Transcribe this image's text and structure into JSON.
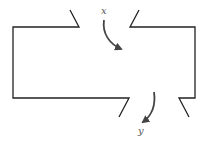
{
  "diagram": {
    "type": "control-volume",
    "labels": {
      "inflow": "x",
      "outflow": "y"
    },
    "colors": {
      "stroke": "#222222",
      "arrow": "#444444",
      "label": "#555555"
    }
  }
}
